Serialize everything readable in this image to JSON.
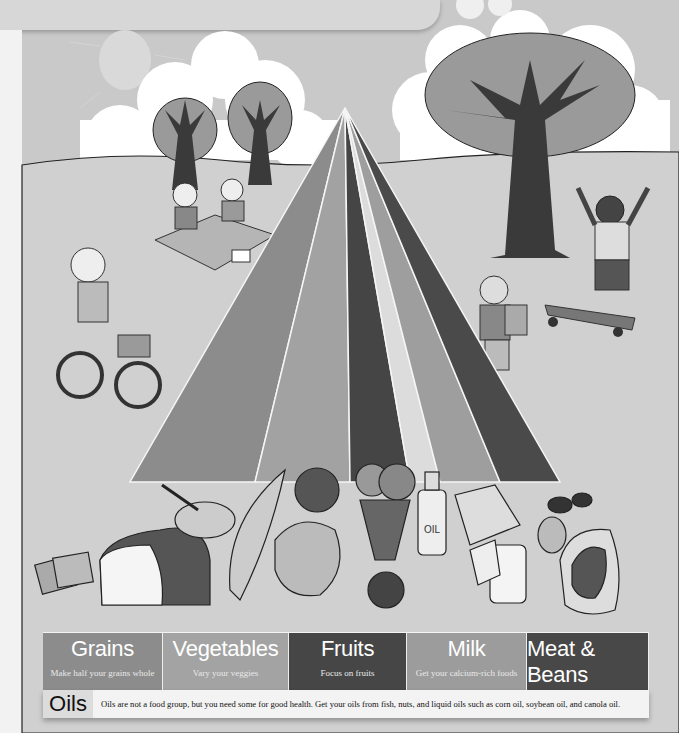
{
  "poster": {
    "title": "MyPyramid food guide illustration",
    "colors": {
      "background": "#c9c9c9",
      "grains": "#8c8c8c",
      "vegetables": "#a2a2a2",
      "fruits": "#454545",
      "oils": "#dcdcdc",
      "milk": "#9e9e9e",
      "meat_beans": "#4a4a4a"
    }
  },
  "pyramid": {
    "stripes": [
      {
        "group": "grains",
        "color": "#8c8c8c"
      },
      {
        "group": "vegetables",
        "color": "#a2a2a2"
      },
      {
        "group": "fruits",
        "color": "#454545"
      },
      {
        "group": "oils",
        "color": "#dcdcdc"
      },
      {
        "group": "milk",
        "color": "#9e9e9e"
      },
      {
        "group": "meat_beans",
        "color": "#4a4a4a"
      }
    ]
  },
  "food_groups": [
    {
      "title": "Grains",
      "subtitle": "Make half your grains whole",
      "color": "#8c8c8c",
      "width": 120
    },
    {
      "title": "Vegetables",
      "subtitle": "Vary your veggies",
      "color": "#a3a3a3",
      "width": 126
    },
    {
      "title": "Fruits",
      "subtitle": "Focus on fruits",
      "color": "#464646",
      "width": 118
    },
    {
      "title": "Milk",
      "subtitle": "Get your calcium-rich foods",
      "color": "#9c9c9c",
      "width": 120
    },
    {
      "title": "Meat & Beans",
      "subtitle": "Go lean with protein",
      "color": "#484848",
      "width": 122
    }
  ],
  "oils": {
    "label": "Oils",
    "text": "Oils are not a food group, but you need some for good health. Get your oils from fish, nuts, and liquid oils such as corn oil, soybean oil, and canola oil."
  },
  "illustration": {
    "elements": [
      "sun",
      "clouds",
      "trees",
      "picnic-family",
      "girl-on-bicycle",
      "boy-climbing-pyramid",
      "boy-on-skateboard",
      "bread",
      "crackers",
      "cereal-bowl",
      "corn",
      "tomato",
      "lettuce",
      "grapes",
      "oranges",
      "apple",
      "oil-bottle",
      "cheese",
      "milk-glass",
      "beans",
      "eggs",
      "steak"
    ],
    "oil_bottle_label": "OIL"
  }
}
